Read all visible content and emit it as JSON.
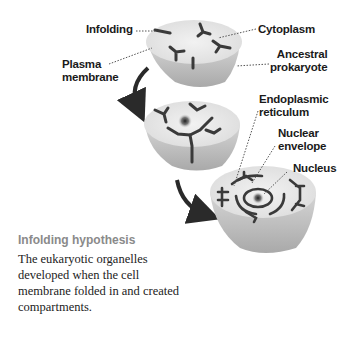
{
  "diagram": {
    "labels": {
      "infolding": "Infolding",
      "plasma_membrane_line1": "Plasma",
      "plasma_membrane_line2": "membrane",
      "cytoplasm": "Cytoplasm",
      "ancestral_prokaryote_line1": "Ancestral",
      "ancestral_prokaryote_line2": "prokaryote",
      "endoplasmic_reticulum_line1": "Endoplasmic",
      "endoplasmic_reticulum_line2": "reticulum",
      "nuclear_envelope_line1": "Nuclear",
      "nuclear_envelope_line2": "envelope",
      "nucleus": "Nucleus"
    },
    "stages": [
      "Ancestral prokaryote",
      "Intermediate infolding cell",
      "Eukaryotic cell"
    ],
    "colors": {
      "cell_fill": "#e8e8e8",
      "cell_side": "#bdbdbd",
      "membrane_folds": "#3a3a3a",
      "caption_title": "#8a8a8a",
      "label_text": "#1a1a1a"
    }
  },
  "caption": {
    "title": "Infolding hypothesis",
    "body": "The eukaryotic organelles developed when the cell membrane folded in and created compartments."
  }
}
